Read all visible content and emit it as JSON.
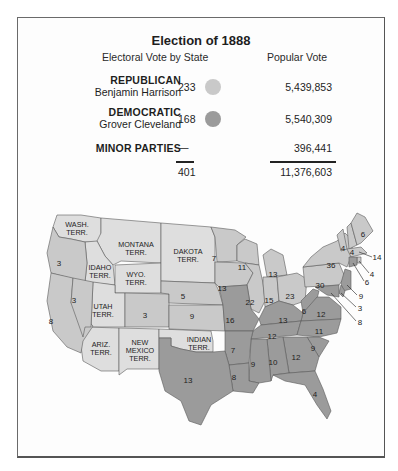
{
  "title": "Election of 1888",
  "headers": {
    "electoral": "Electoral Vote by State",
    "popular": "Popular Vote"
  },
  "colors": {
    "republican": "#c9c9c9",
    "democratic": "#9b9b9b",
    "territory": "#dedede",
    "border": "#5a5a5a"
  },
  "parties": [
    {
      "party": "REPUBLICAN",
      "candidate": "Benjamin Harrison",
      "electoral": "233",
      "popular": "5,439,853",
      "color_key": "republican"
    },
    {
      "party": "DEMOCRATIC",
      "candidate": "Grover Cleveland",
      "electoral": "168",
      "popular": "5,540,309",
      "color_key": "democratic"
    },
    {
      "party": "MINOR PARTIES",
      "candidate": "",
      "electoral": "—",
      "popular": "396,441"
    }
  ],
  "totals": {
    "electoral": "401",
    "popular": "11,376,603"
  },
  "map": {
    "territories": [
      {
        "name": "WASH.",
        "line2": "TERR."
      },
      {
        "name": "MONTANA",
        "line2": "TERR."
      },
      {
        "name": "DAKOTA",
        "line2": "TERR."
      },
      {
        "name": "IDAHO",
        "line2": "TERR."
      },
      {
        "name": "WYO.",
        "line2": "TERR."
      },
      {
        "name": "UTAH",
        "line2": "TERR."
      },
      {
        "name": "ARIZ.",
        "line2": "TERR."
      },
      {
        "name": "NEW",
        "line2": "MEXICO",
        "line3": "TERR."
      },
      {
        "name": "INDIAN",
        "line2": "TERR."
      }
    ],
    "state_votes": {
      "oregon": "3",
      "nevada": "3",
      "california": "8",
      "colorado": "3",
      "nebraska": "5",
      "kansas": "9",
      "minnesota": "7",
      "iowa": "13",
      "wisconsin": "11",
      "michigan": "13",
      "illinois": "22",
      "indiana": "15",
      "ohio": "23",
      "pennsylvania": "30",
      "new_york": "36",
      "maine": "6",
      "vermont": "4",
      "new_hampshire": "4",
      "massachusetts": "14",
      "rhode_island": "4",
      "connecticut": "6",
      "new_jersey": "9",
      "delaware": "3",
      "maryland": "8",
      "west_virginia": "6",
      "virginia": "12",
      "kentucky": "13",
      "missouri": "16",
      "tennessee": "12",
      "north_carolina": "11",
      "south_carolina": "9",
      "georgia": "12",
      "alabama": "10",
      "mississippi": "9",
      "arkansas": "7",
      "louisiana": "8",
      "texas": "13",
      "florida": "4"
    }
  }
}
